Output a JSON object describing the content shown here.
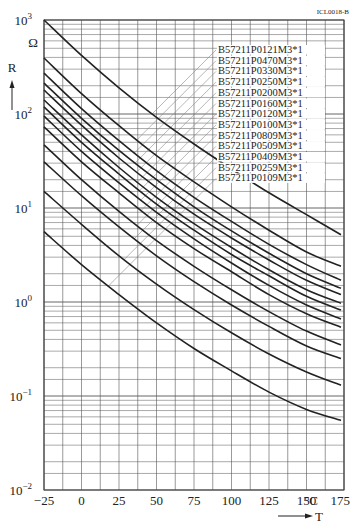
{
  "chart_data": {
    "type": "line",
    "title": "",
    "figure_code": "ICL0018-B",
    "xlabel": "T",
    "x_unit": "°C",
    "ylabel": "R",
    "y_unit": "Ω",
    "xlim": [
      -25,
      175
    ],
    "ylim": [
      0.01,
      1000
    ],
    "yscale": "log",
    "grid": true,
    "x_ticks": [
      "-25",
      "0",
      "25",
      "50",
      "75",
      "100",
      "125",
      "150",
      "175"
    ],
    "y_ticks": [
      "10^-2",
      "10^-1",
      "10^0",
      "10^1",
      "10^2",
      "10^3"
    ],
    "legend_position": "upper right, leader lines to curves",
    "x": [
      -25,
      0,
      25,
      50,
      75,
      100,
      125,
      150,
      173
    ],
    "series": [
      {
        "name": "B57211P0121M3*1",
        "values": [
          1000,
          420,
          190,
          92,
          48,
          26,
          14.5,
          8.5,
          5.2
        ]
      },
      {
        "name": "B57211P0470M3*1",
        "values": [
          394,
          165,
          75,
          36,
          19,
          10.3,
          5.8,
          3.4,
          2.4
        ]
      },
      {
        "name": "B57211P0330M3*1",
        "values": [
          272,
          114,
          52,
          25,
          13,
          7.2,
          4.1,
          2.5,
          1.7
        ]
      },
      {
        "name": "B57211P0250M3*1",
        "values": [
          213,
          90,
          41,
          20,
          10.3,
          5.7,
          3.3,
          2.0,
          1.4
        ]
      },
      {
        "name": "B57211P0200M3*1",
        "values": [
          180,
          76,
          34,
          16.5,
          8.6,
          4.8,
          2.8,
          1.7,
          1.2
        ]
      },
      {
        "name": "B57211P0160M3*1",
        "values": [
          141,
          60,
          27,
          13,
          6.8,
          3.8,
          2.2,
          1.35,
          0.97
        ]
      },
      {
        "name": "B57211P0120M3*1",
        "values": [
          119,
          50,
          23,
          11,
          5.8,
          3.2,
          1.9,
          1.15,
          0.82
        ]
      },
      {
        "name": "B57211P0100M3*1",
        "values": [
          95,
          40,
          18.5,
          9,
          4.7,
          2.6,
          1.5,
          0.93,
          0.66
        ]
      },
      {
        "name": "B57211P0809M3*1",
        "values": [
          73,
          31,
          14.5,
          7,
          3.7,
          2.1,
          1.2,
          0.75,
          0.54
        ]
      },
      {
        "name": "B57211P0509M3*1",
        "values": [
          47,
          20,
          9.2,
          4.5,
          2.4,
          1.35,
          0.79,
          0.49,
          0.35
        ]
      },
      {
        "name": "B57211P0409M3*1",
        "values": [
          31,
          13.5,
          6.3,
          3.1,
          1.65,
          0.93,
          0.55,
          0.34,
          0.25
        ]
      },
      {
        "name": "B57211P0259M3*1",
        "values": [
          15,
          6.7,
          3.1,
          1.55,
          0.83,
          0.47,
          0.28,
          0.18,
          0.13
        ]
      },
      {
        "name": "B57211P0109M3*1",
        "values": [
          5.6,
          2.5,
          1.2,
          0.6,
          0.32,
          0.185,
          0.11,
          0.072,
          0.055
        ]
      }
    ]
  },
  "labels": {
    "y_axis_symbol": "R",
    "y_axis_unit": "Ω",
    "x_axis_symbol": "T",
    "x_axis_unit": "°C",
    "figure_code": "ICL0018-B"
  }
}
